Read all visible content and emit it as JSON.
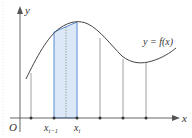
{
  "figure": {
    "origin_label": "O",
    "x_axis_label": "x",
    "y_axis_label": "y",
    "curve_label": "y = f(x)",
    "tick_labels": {
      "left_of_strip": "x",
      "left_of_strip_sub": "i−1",
      "right_of_strip": "x",
      "right_of_strip_sub": "i"
    },
    "colors": {
      "axis": "#555555",
      "curve": "#444444",
      "strip_fill": "#dce8f8",
      "strip_border": "#5b8bd0",
      "dotted_line": "#6a8a6a"
    }
  }
}
